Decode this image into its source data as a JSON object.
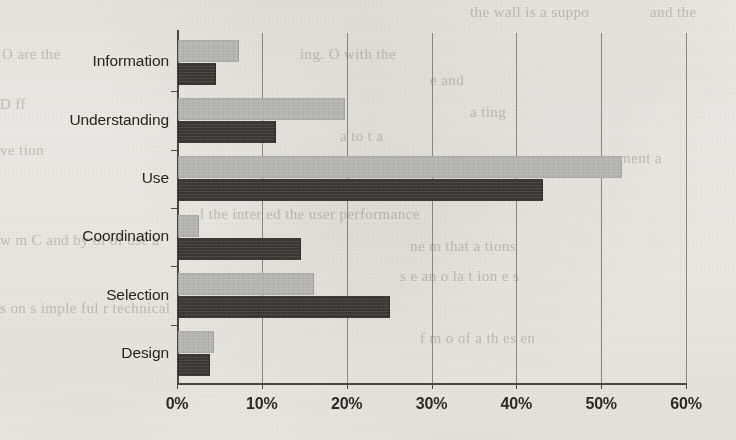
{
  "chart_data": {
    "type": "bar",
    "orientation": "horizontal",
    "title": "",
    "subtitle": "",
    "xlabel": "",
    "ylabel": "",
    "categories": [
      "Information",
      "Understanding",
      "Use",
      "Coordination",
      "Selection",
      "Design"
    ],
    "series": [
      {
        "name": "light-gray-series",
        "color": "#b4b4b2",
        "values": [
          7.2,
          19.7,
          52.3,
          2.5,
          16.0,
          4.2
        ]
      },
      {
        "name": "dark-gray-series",
        "color": "#3a3935",
        "values": [
          4.5,
          11.5,
          43.0,
          14.5,
          25.0,
          3.8
        ]
      }
    ],
    "xlim": [
      0,
      60
    ],
    "xticks": [
      0,
      10,
      20,
      30,
      40,
      50,
      60
    ],
    "xtick_labels": [
      "0%",
      "10%",
      "20%",
      "30%",
      "40%",
      "50%",
      "60%"
    ],
    "grid": true,
    "grid_axis": "x",
    "legend": null,
    "value_suffix": "%"
  },
  "background_text": {
    "lines": [
      "the wall is a suppo",
      "and the",
      "O are the",
      "ing. O with the",
      "e and",
      "D  ff",
      "a ting",
      "a to t a ",
      "ve  tion ",
      "pe ment  a",
      "l  the  inter  ed  the  user  performance",
      "w  m  C  and  by  ol  of  use  a",
      "ne  m  that  a  tions",
      "s  e  an  o  la  t  ion  e  s",
      "s  on  s  imple  ful  r  technical",
      "f  m  o  of  a  th  es  en"
    ]
  }
}
